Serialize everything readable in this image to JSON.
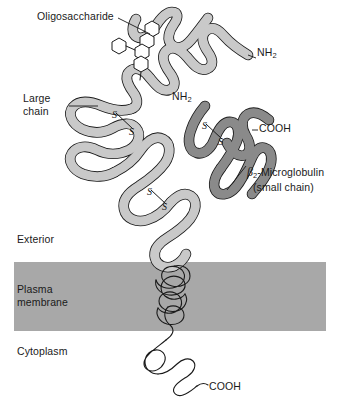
{
  "figure": {
    "background_color": "#ffffff"
  },
  "membrane": {
    "fill_color": "#a8a8a8",
    "top_label": "Exterior",
    "band_label_line1": "Plasma",
    "band_label_line2": "membrane",
    "bottom_label": "Cytoplasm"
  },
  "chains": {
    "large_chain": {
      "label_line1": "Large",
      "label_line2": "chain",
      "fill_color": "#c9c9c9",
      "stroke_color": "#1a1a1a"
    },
    "small_chain": {
      "label_prefix": "β",
      "label_subscript": "2",
      "label_main": "-Microglobulin",
      "label_line2": "(small chain)",
      "fill_color": "#8a8a8a",
      "stroke_color": "#1a1a1a"
    }
  },
  "oligosaccharide": {
    "label": "Oligosaccharide",
    "ring_count": 5,
    "stroke_color": "#1a1a1a"
  },
  "termini": {
    "nh2_top": "NH",
    "nh2_top_sub": "2",
    "nh2_mid": "NH",
    "nh2_mid_sub": "2",
    "cooh_small_chain": "COOH",
    "cooh_cytoplasm": "COOH"
  },
  "disulfide_bonds": {
    "count": 3,
    "glyph": "S",
    "items": [
      {
        "name": "large-chain-upper"
      },
      {
        "name": "small-chain"
      },
      {
        "name": "large-chain-lower"
      }
    ]
  }
}
